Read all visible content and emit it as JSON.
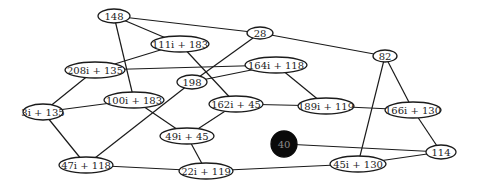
{
  "diagram": {
    "type": "undirected-graph",
    "nodes": [
      {
        "id": "n148",
        "label": "148",
        "x": 114,
        "y": 16,
        "rx": 16,
        "ry": 7,
        "style": "outline"
      },
      {
        "id": "n111",
        "label": "111i + 183",
        "x": 180,
        "y": 44,
        "rx": 29,
        "ry": 8,
        "style": "outline"
      },
      {
        "id": "n28",
        "label": "28",
        "x": 260,
        "y": 33,
        "rx": 13,
        "ry": 6,
        "style": "outline"
      },
      {
        "id": "n82",
        "label": "82",
        "x": 385,
        "y": 56,
        "rx": 12,
        "ry": 6,
        "style": "outline"
      },
      {
        "id": "n208",
        "label": "208i + 135",
        "x": 95,
        "y": 70,
        "rx": 30,
        "ry": 8,
        "style": "outline"
      },
      {
        "id": "n164",
        "label": "164i + 118",
        "x": 276,
        "y": 65,
        "rx": 31,
        "ry": 8,
        "style": "outline"
      },
      {
        "id": "n198",
        "label": "198",
        "x": 192,
        "y": 82,
        "rx": 15,
        "ry": 7,
        "style": "outline"
      },
      {
        "id": "n3",
        "label": "3i + 135",
        "x": 43,
        "y": 112,
        "rx": 20,
        "ry": 8,
        "style": "outline"
      },
      {
        "id": "n100",
        "label": "100i + 183",
        "x": 134,
        "y": 100,
        "rx": 30,
        "ry": 8,
        "style": "outline"
      },
      {
        "id": "n162",
        "label": "162i + 45",
        "x": 236,
        "y": 104,
        "rx": 27,
        "ry": 8,
        "style": "outline"
      },
      {
        "id": "n189",
        "label": "189i + 119",
        "x": 326,
        "y": 106,
        "rx": 28,
        "ry": 8,
        "style": "outline"
      },
      {
        "id": "n166",
        "label": "166i + 130",
        "x": 413,
        "y": 110,
        "rx": 28,
        "ry": 8,
        "style": "outline"
      },
      {
        "id": "n49",
        "label": "49i + 45",
        "x": 187,
        "y": 136,
        "rx": 27,
        "ry": 8,
        "style": "outline"
      },
      {
        "id": "n40",
        "label": "40",
        "x": 284,
        "y": 144,
        "rx": 13,
        "ry": 13,
        "style": "filled"
      },
      {
        "id": "n114",
        "label": "114",
        "x": 441,
        "y": 152,
        "rx": 15,
        "ry": 7,
        "style": "outline"
      },
      {
        "id": "n47",
        "label": "47i + 118",
        "x": 86,
        "y": 165,
        "rx": 27,
        "ry": 8,
        "style": "outline"
      },
      {
        "id": "n22",
        "label": "22i + 119",
        "x": 206,
        "y": 171,
        "rx": 27,
        "ry": 8,
        "style": "outline"
      },
      {
        "id": "n45",
        "label": "45i + 130",
        "x": 358,
        "y": 164,
        "rx": 28,
        "ry": 8,
        "style": "outline"
      }
    ],
    "edges": [
      [
        "n148",
        "n28"
      ],
      [
        "n148",
        "n111"
      ],
      [
        "n148",
        "n100"
      ],
      [
        "n111",
        "n208"
      ],
      [
        "n111",
        "n162"
      ],
      [
        "n208",
        "n164"
      ],
      [
        "n208",
        "n3"
      ],
      [
        "n28",
        "n198"
      ],
      [
        "n28",
        "n82"
      ],
      [
        "n198",
        "n164"
      ],
      [
        "n198",
        "n47"
      ],
      [
        "n164",
        "n189"
      ],
      [
        "n3",
        "n100"
      ],
      [
        "n3",
        "n47"
      ],
      [
        "n100",
        "n49"
      ],
      [
        "n162",
        "n49"
      ],
      [
        "n162",
        "n189"
      ],
      [
        "n49",
        "n22"
      ],
      [
        "n47",
        "n22"
      ],
      [
        "n22",
        "n45"
      ],
      [
        "n189",
        "n166"
      ],
      [
        "n82",
        "n166"
      ],
      [
        "n82",
        "n45"
      ],
      [
        "n166",
        "n114"
      ],
      [
        "n40",
        "n114"
      ],
      [
        "n45",
        "n114"
      ]
    ],
    "colors": {
      "background": "#ffffff",
      "stroke": "#1a1a1a",
      "filled_node": "#0a0a0a",
      "filled_node_text": "#8a8a8a",
      "text": "#222222"
    }
  }
}
